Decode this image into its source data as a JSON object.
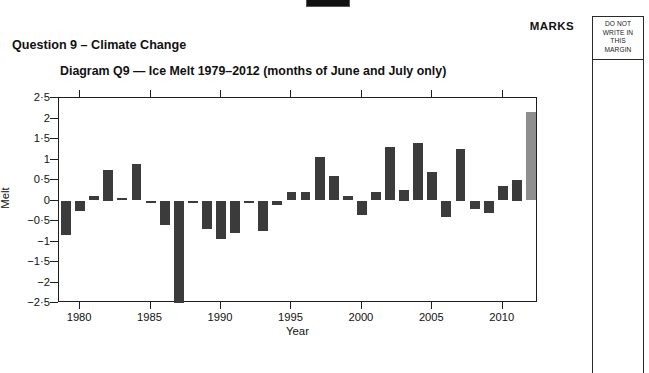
{
  "page": {
    "marks_label": "MARKS",
    "margin_notice": [
      "DO NOT",
      "WRITE IN",
      "THIS",
      "MARGIN"
    ],
    "question_title": "Question 9 – Climate Change",
    "diagram_title": "Diagram Q9 — Ice Melt 1979–2012 (months of June and July only)"
  },
  "colors": {
    "bar": "#3b3b3b",
    "bar_highlight": "#8e8e8e",
    "axis": "#1d1d1d",
    "text": "#111111",
    "background": "#ffffff"
  },
  "chart_data": {
    "type": "bar",
    "title": "Diagram Q9 — Ice Melt 1979–2012 (months of June and July only)",
    "xlabel": "Year",
    "ylabel": "Melt",
    "ylim": [
      -2.5,
      2.5
    ],
    "xlim": [
      1978.5,
      2012.5
    ],
    "grid": false,
    "legend": null,
    "ytick_labels": [
      "2·5",
      "2",
      "1·5",
      "1",
      "0·5",
      "0",
      "−0·5",
      "−1",
      "−1·5",
      "−2",
      "−2·5"
    ],
    "ytick_values": [
      2.5,
      2,
      1.5,
      1,
      0.5,
      0,
      -0.5,
      -1,
      -1.5,
      -2,
      -2.5
    ],
    "xtick_labels": [
      "1980",
      "1985",
      "1990",
      "1995",
      "2000",
      "2005",
      "2010"
    ],
    "xtick_values": [
      1980,
      1985,
      1990,
      1995,
      2000,
      2005,
      2010
    ],
    "highlight_index": 33,
    "highlight_note": "final bar (2012) drawn in lighter grey",
    "categories": [
      1979,
      1980,
      1981,
      1982,
      1983,
      1984,
      1985,
      1986,
      1987,
      1988,
      1989,
      1990,
      1991,
      1992,
      1993,
      1994,
      1995,
      1996,
      1997,
      1998,
      1999,
      2000,
      2001,
      2002,
      2003,
      2004,
      2005,
      2006,
      2007,
      2008,
      2009,
      2010,
      2011,
      2012
    ],
    "values": [
      -0.85,
      -0.25,
      0.1,
      0.75,
      0.05,
      0.9,
      -0.05,
      -0.6,
      -2.5,
      -0.05,
      -0.7,
      -0.95,
      -0.8,
      -0.05,
      -0.75,
      -0.1,
      0.2,
      0.2,
      1.05,
      0.6,
      0.1,
      -0.35,
      0.2,
      1.3,
      0.25,
      1.4,
      0.7,
      -0.4,
      1.25,
      -0.2,
      -0.3,
      0.35,
      0.5,
      2.15
    ]
  }
}
